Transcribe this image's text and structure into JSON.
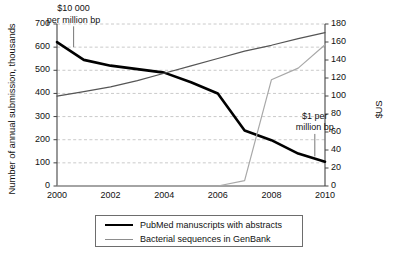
{
  "chart_data": {
    "type": "line",
    "title": "",
    "xlabel": "",
    "ylabel": "Number of annual submission, thousands",
    "y2label": "$US",
    "xlim": [
      2000,
      2010
    ],
    "ylim": [
      0,
      700
    ],
    "y2lim": [
      0,
      180
    ],
    "grid": true,
    "legend_position": "bottom",
    "x_ticks": [
      "2000",
      "2002",
      "2004",
      "2006",
      "2008",
      "2010"
    ],
    "y_ticks": [
      "0",
      "100",
      "200",
      "300",
      "400",
      "500",
      "600",
      "700"
    ],
    "y2_ticks": [
      "0",
      "20",
      "40",
      "60",
      "80",
      "100",
      "120",
      "140",
      "160",
      "180"
    ],
    "x": [
      2000,
      2001,
      2002,
      2003,
      2004,
      2005,
      2006,
      2007,
      2008,
      2009,
      2010
    ],
    "series": [
      {
        "name": "PubMed manuscripts with abstracts",
        "axis": "left",
        "color": "#000000",
        "width": 2.6,
        "values": [
          622,
          545,
          520,
          505,
          490,
          448,
          400,
          240,
          198,
          140,
          105
        ]
      },
      {
        "name": "Bacterial sequences in GenBank",
        "axis": "right",
        "color": "#a8a8a8",
        "width": 1.2,
        "values": [
          0,
          0,
          0,
          0,
          0,
          0,
          0,
          6,
          118,
          131,
          157
        ]
      },
      {
        "name": "cost-trend-line",
        "axis": "left",
        "color": "#555555",
        "width": 1.2,
        "values": [
          388,
          408,
          428,
          455,
          487,
          519,
          551,
          583,
          608,
          637,
          663
        ]
      }
    ],
    "annotations": [
      {
        "name": "ten-thousand-per-million-bp",
        "line1": "$10 000",
        "line2": "per million bp",
        "x": 2000.6,
        "y": 700
      },
      {
        "name": "one-dollar-per-million-bp",
        "line1": "$1 per",
        "line2": "million bp",
        "x": 2009.6,
        "y": 260
      }
    ],
    "legend": [
      {
        "label": "PubMed manuscripts with abstracts",
        "style": "thick"
      },
      {
        "label": "Bacterial sequences in GenBank",
        "style": "thin"
      }
    ]
  }
}
